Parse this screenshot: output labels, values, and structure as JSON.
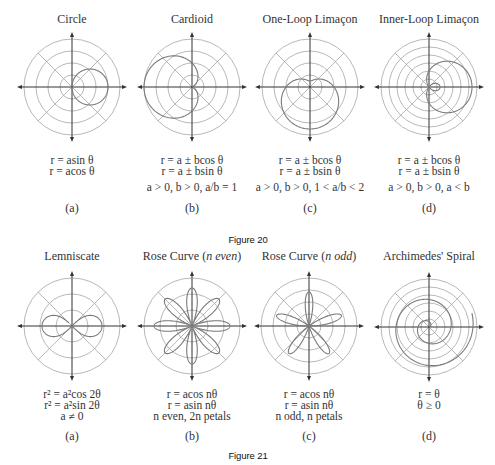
{
  "chart_data": [
    {
      "figure": "Figure 20",
      "type": "polar-diagram-grid",
      "panels": [
        {
          "label": "(a)",
          "title": "Circle",
          "equations": [
            "r = asin θ",
            "r = acos θ"
          ],
          "condition": "",
          "plotted": "r = a cos θ",
          "rings": 4
        },
        {
          "label": "(b)",
          "title": "Cardioid",
          "equations": [
            "r = a ± bcos θ",
            "r = a ± bsin θ"
          ],
          "condition": "a > 0, b > 0, a/b = 1",
          "plotted": "r = a(1 − cos θ)",
          "rings": 4
        },
        {
          "label": "(c)",
          "title": "One-Loop Limaçon",
          "equations": [
            "r = a ± bcos θ",
            "r = a ± bsin θ"
          ],
          "condition": "a > 0, b > 0, 1 < a/b < 2",
          "plotted": "r = a − b sin θ",
          "rings": 4
        },
        {
          "label": "(d)",
          "title": "Inner-Loop Limaçon",
          "equations": [
            "r = a ± bcos θ",
            "r = a ± bsin θ"
          ],
          "condition": "a > 0, b > 0, a < b",
          "plotted": "r = a + b cos θ (a<b)",
          "rings": 6
        }
      ]
    },
    {
      "figure": "Figure 21",
      "type": "polar-diagram-grid",
      "panels": [
        {
          "label": "(a)",
          "title": "Lemniscate",
          "equations": [
            "r² = a²cos 2θ",
            "r² = a²sin 2θ",
            "a ≠ 0"
          ],
          "plotted": "r² = a² cos 2θ",
          "rings": 3
        },
        {
          "label": "(b)",
          "title": "Rose Curve (n even)",
          "equations": [
            "r = acos nθ",
            "r = asin nθ",
            "n even, 2n petals"
          ],
          "plotted": "r = a cos 4θ (8 petals)",
          "rings": 3
        },
        {
          "label": "(c)",
          "title": "Rose Curve (n odd)",
          "equations": [
            "r = acos nθ",
            "r = asin nθ",
            "n odd, n petals"
          ],
          "plotted": "r = a sin 5θ (5 petals)",
          "rings": 4
        },
        {
          "label": "(d)",
          "title": "Archimedes' Spiral",
          "equations": [
            "r = θ",
            "θ ≥ 0"
          ],
          "plotted": "r = θ",
          "rings": 6
        }
      ]
    }
  ],
  "fig20": {
    "caption": "Figure 20",
    "a": {
      "title": "Circle",
      "eq1": "r = asin θ",
      "eq2": "r = acos θ",
      "label": "(a)"
    },
    "b": {
      "title": "Cardioid",
      "eq1": "r = a ± bcos θ",
      "eq2": "r = a ± bsin θ",
      "cond": "a > 0, b > 0, a/b = 1",
      "label": "(b)"
    },
    "c": {
      "title": "One-Loop Limaçon",
      "eq1": "r = a ± bcos θ",
      "eq2": "r = a ± bsin θ",
      "cond": "a > 0, b > 0, 1 < a/b < 2",
      "label": "(c)"
    },
    "d": {
      "title": "Inner-Loop Limaçon",
      "eq1": "r = a ± bcos θ",
      "eq2": "r = a ± bsin θ",
      "cond": "a > 0, b > 0, a < b",
      "label": "(d)"
    }
  },
  "fig21": {
    "caption": "Figure 21",
    "a": {
      "title": "Lemniscate",
      "eq1": "r² = a²cos 2θ",
      "eq2": "r² = a²sin 2θ",
      "eq3": "a ≠ 0",
      "label": "(a)"
    },
    "b": {
      "title": "Rose Curve (n even)",
      "eq1": "r = acos nθ",
      "eq2": "r = asin nθ",
      "eq3": "n even, 2n petals",
      "label": "(b)"
    },
    "c": {
      "title": "Rose Curve (n odd)",
      "eq1": "r = acos nθ",
      "eq2": "r = asin nθ",
      "eq3": "n odd, n petals",
      "label": "(c)"
    },
    "d": {
      "title": "Archimedes' Spiral",
      "eq1": "r = θ",
      "eq2": "θ ≥ 0",
      "label": "(d)"
    }
  },
  "colors": {
    "grid": "#9a9a9a",
    "axis": "#333333",
    "curve": "#7a7a7a",
    "text": "#333333"
  }
}
